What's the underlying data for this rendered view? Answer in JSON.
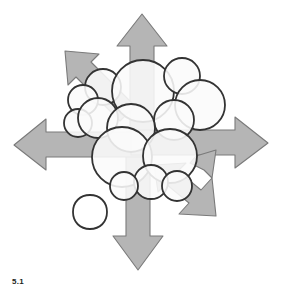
{
  "figure": {
    "caption": "5.1",
    "background_color": "#ffffff",
    "arrow_fill": "#b5b5b5",
    "arrow_stroke": "#7a7a7a",
    "circle_fill": "#fafafa",
    "circle_stroke": "#333333",
    "caption_color": "#231f20"
  },
  "chart_data": {
    "type": "diagram",
    "title": "5.1",
    "arrows": [
      {
        "name": "arrow-up",
        "direction": "up",
        "label": ""
      },
      {
        "name": "arrow-down",
        "direction": "down",
        "label": ""
      },
      {
        "name": "arrow-left",
        "direction": "left",
        "label": ""
      },
      {
        "name": "arrow-right",
        "direction": "right",
        "label": ""
      },
      {
        "name": "arrow-diagonal-up-left",
        "direction": "up-left",
        "label": ""
      },
      {
        "name": "arrow-diagonal-down-right",
        "direction": "down-right",
        "label": ""
      }
    ],
    "circles": [
      {
        "cx": 103,
        "cy": 87,
        "r": 18
      },
      {
        "cx": 83,
        "cy": 100,
        "r": 15
      },
      {
        "cx": 78,
        "cy": 123,
        "r": 14
      },
      {
        "cx": 98,
        "cy": 118,
        "r": 20
      },
      {
        "cx": 143,
        "cy": 91,
        "r": 31
      },
      {
        "cx": 182,
        "cy": 76,
        "r": 18
      },
      {
        "cx": 200,
        "cy": 105,
        "r": 25
      },
      {
        "cx": 174,
        "cy": 120,
        "r": 20
      },
      {
        "cx": 131,
        "cy": 128,
        "r": 24
      },
      {
        "cx": 122,
        "cy": 157,
        "r": 30
      },
      {
        "cx": 170,
        "cy": 156,
        "r": 27
      },
      {
        "cx": 151,
        "cy": 182,
        "r": 17
      },
      {
        "cx": 124,
        "cy": 186,
        "r": 14
      },
      {
        "cx": 177,
        "cy": 186,
        "r": 15
      },
      {
        "cx": 90,
        "cy": 212,
        "r": 17
      }
    ]
  }
}
